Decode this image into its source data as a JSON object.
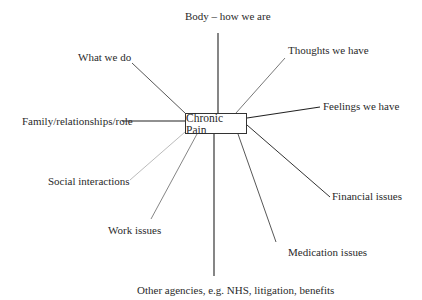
{
  "diagram": {
    "center": {
      "label": "Chronic Pain"
    },
    "nodes": [
      {
        "id": "body",
        "label": "Body – how we are"
      },
      {
        "id": "thoughts",
        "label": "Thoughts we have"
      },
      {
        "id": "feelings",
        "label": "Feelings we have"
      },
      {
        "id": "financial",
        "label": "Financial issues"
      },
      {
        "id": "medication",
        "label": "Medication issues"
      },
      {
        "id": "other-agencies",
        "label": "Other agencies, e.g. NHS, litigation, benefits"
      },
      {
        "id": "work",
        "label": "Work issues"
      },
      {
        "id": "social",
        "label": "Social interactions"
      },
      {
        "id": "family",
        "label": "Family/relationships/role"
      },
      {
        "id": "what-we-do",
        "label": "What we do"
      }
    ],
    "edges": [
      {
        "from": "center",
        "to": "body"
      },
      {
        "from": "center",
        "to": "thoughts"
      },
      {
        "from": "center",
        "to": "feelings"
      },
      {
        "from": "center",
        "to": "financial"
      },
      {
        "from": "center",
        "to": "medication"
      },
      {
        "from": "center",
        "to": "other-agencies"
      },
      {
        "from": "center",
        "to": "work"
      },
      {
        "from": "center",
        "to": "social"
      },
      {
        "from": "center",
        "to": "family"
      },
      {
        "from": "center",
        "to": "what-we-do"
      }
    ]
  }
}
